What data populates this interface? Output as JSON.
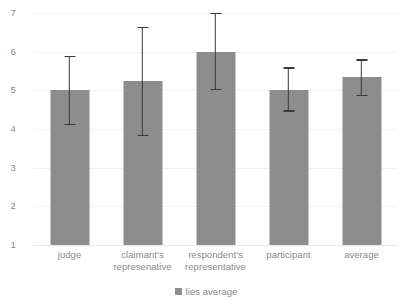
{
  "chart_data": {
    "type": "bar",
    "title": "",
    "subtitle": "",
    "xlabel": "",
    "ylabel": "",
    "categories": [
      "judge",
      "claimant's represenative",
      "respondent's representative",
      "participant",
      "average"
    ],
    "category_lines": [
      [
        "judge"
      ],
      [
        "claimant's",
        "represenative"
      ],
      [
        "respondent's",
        "representative"
      ],
      [
        "participant"
      ],
      [
        "average"
      ]
    ],
    "series": [
      {
        "name": "lies average",
        "values": [
          5.0,
          5.25,
          6.0,
          5.02,
          5.35
        ],
        "error_low": [
          4.1,
          3.82,
          5.0,
          4.45,
          4.85
        ],
        "error_high": [
          5.9,
          6.65,
          7.0,
          5.6,
          5.8
        ],
        "color": "#8d8d8d"
      }
    ],
    "ylim": [
      1,
      7
    ],
    "yticks": [
      1,
      2,
      3,
      4,
      5,
      6,
      7
    ],
    "ytick_labels": [
      "1",
      "2",
      "3",
      "4",
      "5",
      "6",
      "7"
    ],
    "grid": true,
    "grid_axis": "y",
    "legend": {
      "position": "bottom",
      "entries": [
        {
          "label": "lies average",
          "color": "#8d8d8d",
          "marker": "square"
        }
      ]
    },
    "error_bar_color": "#3a3a3a",
    "gridline_color": "#f2f2f2",
    "tick_label_color": "#8a8a8a",
    "background": "#ffffff"
  }
}
